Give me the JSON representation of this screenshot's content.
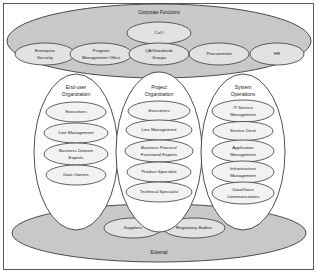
{
  "diagram": {
    "frame_color": "#5a5a5a",
    "zone_color": "#c8c8c8",
    "group_color": "#ffffff",
    "node_color": "#f2f2f2",
    "zones": {
      "corporate": {
        "label": "Corporate Functions",
        "top_node": "CxO",
        "nodes": [
          "Enterprise Security",
          "Program Management Office",
          "QA/Standards Groups",
          "Procurement",
          "HR"
        ]
      },
      "external": {
        "label": "External",
        "nodes": [
          "Suppliers",
          "Regulatory Bodies"
        ]
      }
    },
    "groups": [
      {
        "label": "End-user Organization",
        "nodes": [
          "Executives",
          "Line Management",
          "Business Domain Experts",
          "Data Owners"
        ]
      },
      {
        "label": "Project Organization",
        "nodes": [
          "Executives",
          "Line Management",
          "Business Process/Functional Experts",
          "Product Specialist",
          "Technical Specialist"
        ]
      },
      {
        "label": "System Operations",
        "nodes": [
          "IT Service Management",
          "Service Desk",
          "Application Management",
          "Infrastructure Management",
          "Data/Voice Communications"
        ]
      }
    ]
  }
}
